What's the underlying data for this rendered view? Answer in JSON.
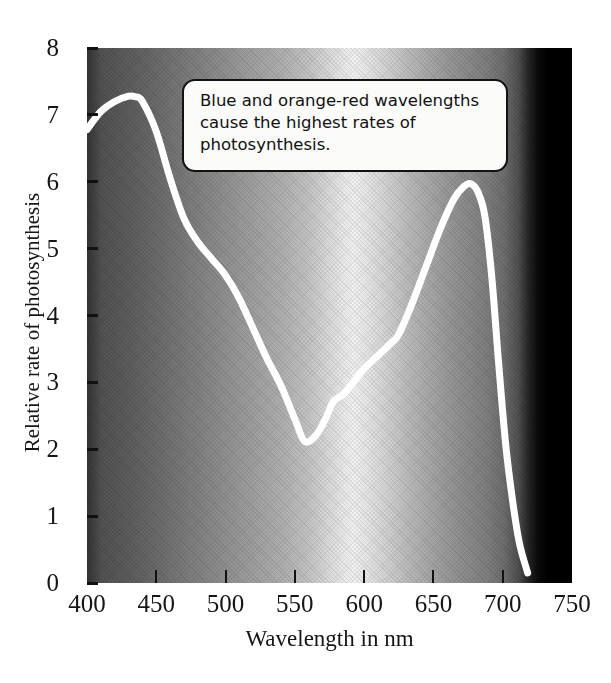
{
  "figure": {
    "annotation": {
      "text": "Blue and orange-red wavelengths cause the highest rates of photosynthesis."
    }
  },
  "chart_data": {
    "type": "line",
    "title": "",
    "subtitle": "",
    "xlabel": "Wavelength in nm",
    "ylabel": "Relative rate of photosynthesis",
    "xlim": [
      400,
      750
    ],
    "ylim": [
      0,
      8
    ],
    "xticks": [
      400,
      450,
      500,
      550,
      600,
      650,
      700,
      750
    ],
    "yticks": [
      0,
      1,
      2,
      3,
      4,
      5,
      6,
      7,
      8
    ],
    "grid": false,
    "legend": null,
    "background": "grayscale visible-light spectrum band from 400 nm to about 710 nm, black beyond",
    "series": [
      {
        "name": "Relative rate of photosynthesis",
        "color": "#ffffff",
        "line_width": 7,
        "x": [
          400,
          410,
          420,
          430,
          435,
          440,
          450,
          460,
          470,
          480,
          490,
          500,
          510,
          520,
          530,
          540,
          550,
          557,
          565,
          572,
          578,
          585,
          592,
          600,
          610,
          620,
          625,
          635,
          645,
          655,
          665,
          672,
          677,
          682,
          687,
          692,
          697,
          702,
          707,
          712,
          718
        ],
        "y": [
          6.78,
          7.05,
          7.2,
          7.28,
          7.27,
          7.2,
          6.75,
          6.05,
          5.45,
          5.1,
          4.85,
          4.6,
          4.25,
          3.8,
          3.35,
          2.95,
          2.45,
          2.12,
          2.2,
          2.45,
          2.72,
          2.82,
          3.0,
          3.2,
          3.4,
          3.6,
          3.72,
          4.2,
          4.75,
          5.3,
          5.75,
          5.93,
          5.97,
          5.85,
          5.5,
          4.6,
          3.3,
          2.1,
          1.25,
          0.6,
          0.15
        ]
      }
    ],
    "annotations": [
      {
        "name": "callout",
        "text": "Blue and orange-red wavelengths cause the highest rates of photosynthesis.",
        "x_range": [
          478,
          712
        ],
        "y_range": [
          6.15,
          7.5
        ]
      }
    ],
    "notes": {
      "blue_peak_nm": 432,
      "blue_peak_value": 7.28,
      "green_trough_nm": 557,
      "green_trough_value": 2.12,
      "red_peak_nm": 677,
      "red_peak_value": 5.97
    }
  }
}
